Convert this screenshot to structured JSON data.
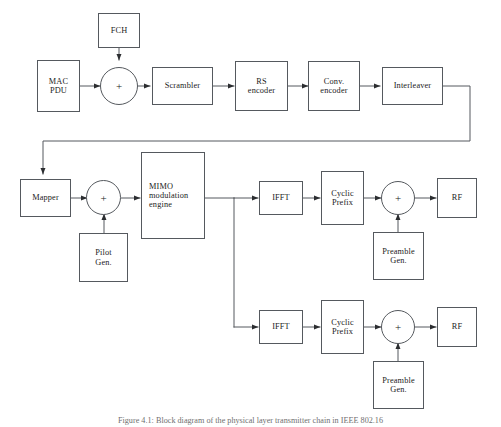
{
  "figure": {
    "caption": "Figure 4.1:  Block diagram of the physical layer transmitter chain in IEEE 802.16",
    "stroke_color": "#55595e",
    "text_color": "#1b1b1b",
    "background": "#ffffff"
  },
  "blocks": {
    "fch": {
      "label": "FCH"
    },
    "mac_pdu": {
      "label": "MAC\nPDU",
      "line1": "MAC",
      "line2": "PDU"
    },
    "scrambler": {
      "label": "Scrambler"
    },
    "rs_encoder": {
      "line1": "RS",
      "line2": "encoder"
    },
    "conv_encoder": {
      "line1": "Conv.",
      "line2": "encoder"
    },
    "interleaver": {
      "label": "Interleaver"
    },
    "mapper": {
      "label": "Mapper"
    },
    "pilot_gen": {
      "line1": "Pilot",
      "line2": "Gen."
    },
    "mimo": {
      "line1": "MIMO",
      "line2": "modulation",
      "line3": "engine"
    },
    "ifft_upper": {
      "label": "IFFT"
    },
    "ifft_lower": {
      "label": "IFFT"
    },
    "cyclic_prefix_upper": {
      "line1": "Cyclic",
      "line2": "Prefix"
    },
    "cyclic_prefix_lower": {
      "line1": "Cyclic",
      "line2": "Prefix"
    },
    "preamble_gen_upper": {
      "line1": "Preamble",
      "line2": "Gen."
    },
    "preamble_gen_lower": {
      "line1": "Preamble",
      "line2": "Gen."
    },
    "rf_upper": {
      "label": "RF"
    },
    "rf_lower": {
      "label": "RF"
    }
  },
  "adders": {
    "input_sum": {
      "symbol": "+"
    },
    "pilot_sum": {
      "symbol": "+"
    },
    "preamble_sum_upper": {
      "symbol": "+"
    },
    "preamble_sum_lower": {
      "symbol": "+"
    }
  },
  "flow": {
    "signal_path": [
      "MAC PDU",
      "input_sum",
      "Scrambler",
      "RS encoder",
      "Conv. encoder",
      "Interleaver",
      "Mapper",
      "pilot_sum",
      "MIMO modulation engine",
      "IFFT",
      "Cyclic Prefix",
      "preamble_sum",
      "RF"
    ],
    "injections": [
      {
        "source": "FCH",
        "target": "input_sum"
      },
      {
        "source": "Pilot Gen.",
        "target": "pilot_sum"
      },
      {
        "source": "Preamble Gen.",
        "target": "preamble_sum_upper"
      },
      {
        "source": "Preamble Gen.",
        "target": "preamble_sum_lower"
      }
    ],
    "branches": 2
  }
}
